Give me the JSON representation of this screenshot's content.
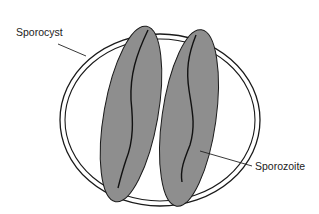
{
  "diagram": {
    "type": "biological-structure",
    "labels": {
      "sporocyst": "Sporocyst",
      "sporozoite": "Sporozoite"
    },
    "colors": {
      "background": "#ffffff",
      "outline": "#1a1a1a",
      "sporozoite_fill": "#8e8e8e",
      "label_text": "#222222"
    },
    "elements": [
      {
        "name": "sporocyst-wall",
        "shape": "double-ring ellipse",
        "count": 1
      },
      {
        "name": "sporozoite",
        "shape": "elongated tilted ellipse with internal wavy line",
        "count": 2
      }
    ]
  }
}
